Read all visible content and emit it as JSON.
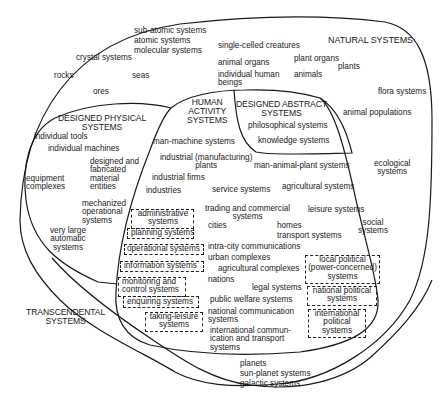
{
  "diagram": {
    "type": "nested-region (Venn-like) classification of systems",
    "regions": {
      "natural": {
        "title": "NATURAL SYSTEMS",
        "items": [
          "sub-atomic systems",
          "atomic systems",
          "molecular systems",
          "crystal systems",
          "rocks",
          "seas",
          "ores",
          "single-celled creatures",
          "animal organs",
          "plant organs",
          "plants",
          "individual human\nbeings",
          "animals",
          "flora systems",
          "animal populations",
          "ecological\nsystems",
          "social\nsystems",
          "planets",
          "sun-planet systems",
          "galactic systems"
        ]
      },
      "designed_physical": {
        "title": "DESIGNED PHYSICAL\nSYSTEMS",
        "items": [
          "individual tools",
          "individual machines",
          "designed and\nfabricated\nmaterial\nentities",
          "equipment\ncomplexes",
          "mechanized\noperational\nsystems",
          "very large\nautomatic\nsystems"
        ]
      },
      "human_activity": {
        "title": "HUMAN\nACTIVITY\nSYSTEMS",
        "items": [
          "man-machine systems",
          "industrial (manufacturing)\nplants",
          "man-animal-plant systems",
          "industrial firms",
          "industries",
          "service systems",
          "agricultural systems",
          "trading and commercial\nsystems",
          "leisure systems",
          "cities",
          "homes",
          "transport systems",
          "intra-city communications",
          "urban complexes",
          "agricultural complexes",
          "nations",
          "legal systems",
          "public welfare systems",
          "national communication\nsystems",
          "international commun-\nication and transport\nsystems"
        ],
        "dashed_boxes": [
          "administrative\nsystems",
          "planning systems",
          "operational systems",
          "information systems",
          "monitoring and\ncontrol systems",
          "enquiring systems",
          "taking-leisure\nsystems",
          "local political\n(power-concerned)\nsystems",
          "national political\nsystems",
          "international\npolitical\nsystems"
        ]
      },
      "designed_abstract": {
        "title": "DESIGNED ABSTRACT\nSYSTEMS",
        "items": [
          "philosophical systems",
          "knowledge systems"
        ]
      },
      "transcendental": {
        "title": "TRANSCENDENTAL\nSYSTEMS"
      }
    },
    "colors": {
      "line": "#1a1a1a",
      "text": "#1a1a1a",
      "background": "#ffffff"
    }
  }
}
